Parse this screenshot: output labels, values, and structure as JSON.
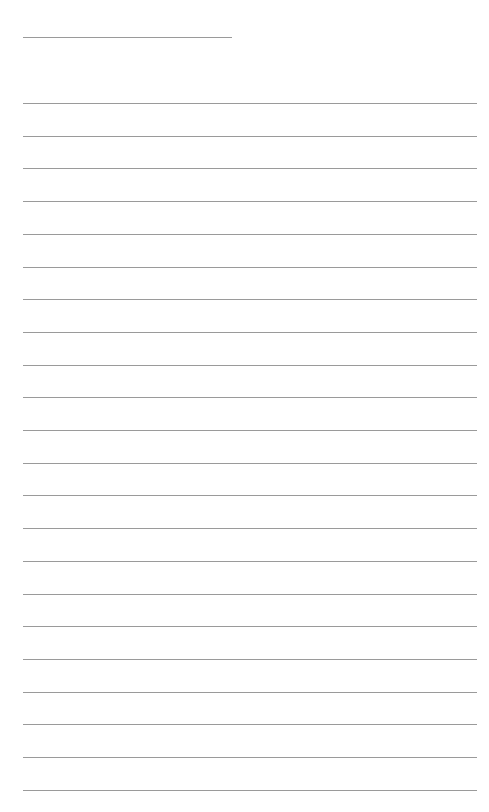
{
  "document": {
    "type": "lined-paper",
    "background_color": "#ffffff",
    "line_color": "#9a9a9a",
    "header_line": {
      "x": 23,
      "y": 37,
      "width": 209,
      "label": ""
    },
    "body_lines": {
      "count": 22,
      "x": 23,
      "width": 454,
      "first_y": 103,
      "spacing": 32.7,
      "texts": [
        "",
        "",
        "",
        "",
        "",
        "",
        "",
        "",
        "",
        "",
        "",
        "",
        "",
        "",
        "",
        "",
        "",
        "",
        "",
        "",
        "",
        ""
      ]
    }
  }
}
